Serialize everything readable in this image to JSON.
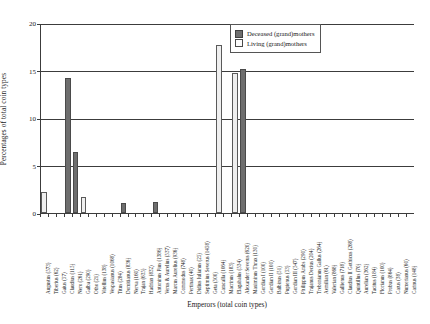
{
  "chart_data": {
    "type": "bar",
    "title": "",
    "xlabel": "Emperors (total coin types)",
    "ylabel": "Percentages of total coin types",
    "ylim": [
      0,
      20
    ],
    "yticks": [
      0,
      5,
      10,
      15,
      20
    ],
    "grid": true,
    "legend_position": "top-right",
    "legend": [
      "Deceased (grand)mothers",
      "Living (grand)mothers"
    ],
    "colors": {
      "deceased": "#6e6e6e",
      "living": "#efefef",
      "axis": "#3c3c3c",
      "background": "#ffffff"
    },
    "categories": [
      "Augustus (573)",
      "Tiberius (62)",
      "Gaius (57)",
      "Claudius (115)",
      "Nero (261)",
      "Galba (290)",
      "Otho (21)",
      "Vitellius (138)",
      "Vespasianus (1068)",
      "Titus (284)",
      "Domitianus (836)",
      "Nerva (160)",
      "Trajan (635)",
      "Hadrian (832)",
      "Antoninus Pius (1386)",
      "Verus & Aurelius (537)",
      "Marcus Aurelius (936)",
      "Commodus (748)",
      "Pertinax (40)",
      "Didius Iulianus (25)",
      "Septimius Severus (1458)",
      "Geta (500)",
      "Caracalla (1064)",
      "Macrinus (183)",
      "Elagabalus (534)",
      "Alexander Severus (620)",
      "Maximinus Thrax (130)",
      "Gordian I (100)",
      "Gordian II (100)",
      "Balbinus (51)",
      "Pupienus (53)",
      "Gordian III (547)",
      "Philippus Arabs (290)",
      "Trajanus Decius (204)",
      "Trebonianus Gallus (264)",
      "Aemilian (61)",
      "Valerian (868)",
      "Gallienus (718)",
      "Claudius II Gothicus (268)",
      "Quintillus (70)",
      "Aurelian (362)",
      "Tacitus (184)",
      "Florianus (100)",
      "Probus (864)",
      "Carus (38)",
      "Numerianus (60)",
      "Carinus (148)"
    ],
    "series": [
      {
        "name": "Deceased (grand)mothers",
        "values": [
          0,
          0,
          0,
          14.0,
          6.2,
          0,
          0,
          0,
          0,
          0,
          0.8,
          0,
          0,
          0,
          0.9,
          0,
          0,
          0,
          0,
          0,
          0,
          0,
          0,
          0,
          0,
          15.0,
          0,
          0,
          0,
          0,
          0,
          0,
          0,
          0,
          0,
          0,
          0,
          0,
          0,
          0,
          0,
          0,
          0,
          0,
          0,
          0,
          0
        ]
      },
      {
        "name": "Living (grand)mothers",
        "values": [
          2.0,
          0,
          0,
          0,
          0,
          1.5,
          0,
          0,
          0,
          0,
          0,
          0,
          0,
          0,
          0,
          0,
          0,
          0,
          0,
          0,
          0,
          0,
          17.5,
          0,
          14.5,
          0,
          0,
          0,
          0,
          0,
          0,
          0,
          0,
          0,
          0,
          0,
          0,
          0,
          0,
          0,
          0,
          0,
          0,
          0,
          0,
          0,
          0
        ]
      }
    ]
  }
}
